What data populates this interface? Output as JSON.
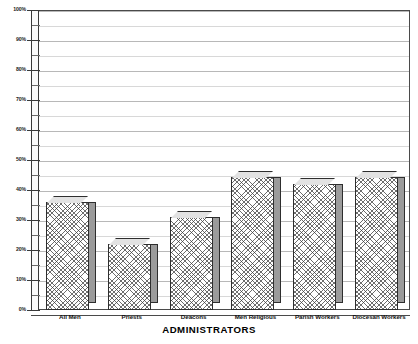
{
  "chart_data": {
    "type": "bar",
    "title": "",
    "subtitle": "",
    "xlabel": "ADMINISTRATORS",
    "ylabel": "",
    "categories": [
      "All Men",
      "Priests",
      "Deacons",
      "Men Religious",
      "Parish Workers",
      "Diocesan Workers"
    ],
    "values": [
      36,
      22,
      31,
      44.5,
      42,
      44.5
    ],
    "value_unit": "%",
    "ylim": [
      0,
      100
    ],
    "y_major_ticks": [
      0,
      10,
      20,
      30,
      40,
      50,
      60,
      70,
      80,
      90,
      100
    ],
    "y_tick_labels": [
      "0%",
      "10%",
      "20%",
      "30%",
      "40%",
      "50%",
      "60%",
      "70%",
      "80%",
      "90%",
      "100%"
    ],
    "y_minor_tick_step": 5,
    "grid": true,
    "grid_axis": "y",
    "legend": false,
    "legend_position": "none",
    "style": "3d-bar",
    "series": [
      {
        "name": "Administrators",
        "values": [
          36,
          22,
          31,
          44.5,
          42,
          44.5
        ]
      }
    ],
    "colors": {
      "bar_fill": "#ffffff",
      "bar_hatch": "#3c3c3c",
      "bar_side": "#9b9b9b",
      "bar_top": "#e2e2e2",
      "bar_outline": "#2e2e2e",
      "gridline_major": "#b8b8b8",
      "gridline_minor": "#d8d8d8",
      "axis": "#3a3a3a",
      "text": "#111111",
      "background": "#ffffff"
    }
  }
}
